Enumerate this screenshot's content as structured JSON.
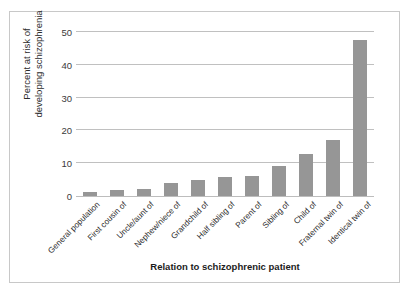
{
  "chart_data": {
    "type": "bar",
    "title": "",
    "xlabel": "Relation to schizophrenic patient",
    "ylabel": "Percent at risk of developing schizophrenia",
    "ylabel_line1": "Percent at risk of",
    "ylabel_line2": "developing schizophrenia",
    "ylim": [
      0,
      50
    ],
    "yticks": [
      0,
      10,
      20,
      30,
      40,
      50
    ],
    "ytick_labels": [
      "0",
      "10",
      "20",
      "30",
      "40",
      "50"
    ],
    "grid": true,
    "grid_axis": "y",
    "legend": false,
    "bar_color": "#969696",
    "gridline_color": "#c0c0c0",
    "background_color": "#ffffff",
    "frame_color": "#c8c8c8",
    "categories": [
      "General population",
      "First cousin of",
      "Uncle/aunt of",
      "Nephew/niece of",
      "Grandchild of",
      "Half sibling of",
      "Parent of",
      "Sibling of",
      "Child of",
      "Fraternal twin of",
      "Identical twin of"
    ],
    "values": [
      1.3,
      1.8,
      2,
      4,
      5,
      5.8,
      6,
      9,
      12.7,
      17,
      47.5
    ]
  }
}
